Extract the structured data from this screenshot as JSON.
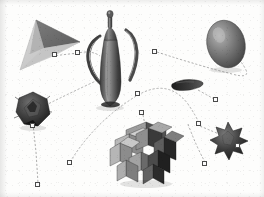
{
  "viewport": {
    "name": "3d-scene-viewport",
    "width": 264,
    "height": 197,
    "background_color": "#fdfdfc",
    "render_mode": "shaded-grayscale"
  },
  "colors": {
    "handle_fill": "#fbfbfb",
    "handle_border": "#4a4a4a",
    "path_stroke": "#9a9a9a",
    "cone_light": "#c9c9c9",
    "cone_dark": "#6e6e6e",
    "pitcher_light": "#8e8e8e",
    "pitcher_dark": "#3a3a3a",
    "egg_light": "#a8a8a8",
    "egg_dark": "#4c4c4c",
    "blade_dark": "#2b2b2b",
    "polyhedron_dark": "#3c3c3c",
    "cubecluster_light": "#b3b3b3",
    "cubecluster_mid": "#808080",
    "cubecluster_dark": "#2f2f2f",
    "star_dark": "#343434"
  },
  "objects": [
    {
      "id": "cone-object",
      "label": "Cone",
      "shape": "cone",
      "x": 38,
      "y": 45,
      "fill_light": "#c9c9c9",
      "fill_dark": "#6e6e6e"
    },
    {
      "id": "pitcher-object",
      "label": "Pitcher",
      "shape": "pitcher",
      "x": 110,
      "y": 57,
      "fill_light": "#8e8e8e",
      "fill_dark": "#3a3a3a"
    },
    {
      "id": "egg-object",
      "label": "Egg",
      "shape": "ellipsoid",
      "x": 226,
      "y": 43,
      "fill_light": "#a8a8a8",
      "fill_dark": "#4c4c4c"
    },
    {
      "id": "blade-object",
      "label": "Blade",
      "shape": "flat-blade",
      "x": 190,
      "y": 84,
      "fill_light": "#555555",
      "fill_dark": "#232323"
    },
    {
      "id": "polyhedron-object",
      "label": "Polyhedron",
      "shape": "faceted-ball",
      "x": 33,
      "y": 110,
      "fill_light": "#6a6a6a",
      "fill_dark": "#262626"
    },
    {
      "id": "cube-cluster-object",
      "label": "Cube Cluster",
      "shape": "polycube",
      "x": 146,
      "y": 157,
      "fill_light": "#b3b3b3",
      "fill_dark": "#2f2f2f"
    },
    {
      "id": "star-polyhedron-object",
      "label": "Star Polyhedron",
      "shape": "stellated",
      "x": 228,
      "y": 140,
      "fill_light": "#6d6d6d",
      "fill_dark": "#232323"
    }
  ],
  "handles": [
    {
      "id": "handle-cone-right",
      "label": "Cone right handle",
      "x": 55,
      "y": 55
    },
    {
      "id": "handle-cone-link",
      "label": "Cone link handle",
      "x": 78,
      "y": 53
    },
    {
      "id": "handle-egg-left",
      "label": "Egg left handle",
      "x": 155,
      "y": 52
    },
    {
      "id": "handle-pitcher-lower",
      "label": "Pitcher lower handle",
      "x": 138,
      "y": 94
    },
    {
      "id": "handle-blade-right",
      "label": "Blade right handle",
      "x": 216,
      "y": 100
    },
    {
      "id": "handle-cluster-top",
      "label": "Cluster top handle",
      "x": 142,
      "y": 113
    },
    {
      "id": "handle-polyhedron-bottom",
      "label": "Polyhedron bottom handle",
      "x": 33,
      "y": 126
    },
    {
      "id": "handle-arc-right",
      "label": "Arc right handle",
      "x": 199,
      "y": 124
    },
    {
      "id": "handle-arc-left",
      "label": "Arc left handle",
      "x": 70,
      "y": 163
    },
    {
      "id": "handle-star-corner",
      "label": "Star corner handle",
      "x": 238,
      "y": 146
    },
    {
      "id": "handle-curve-lower-right",
      "label": "Lower right curve handle",
      "x": 205,
      "y": 164
    },
    {
      "id": "handle-chain-bottom",
      "label": "Chain bottom handle",
      "x": 38,
      "y": 185
    }
  ],
  "connectors": [
    {
      "id": "connector-cone-to-pitcher",
      "label": "Cone to pitcher link"
    },
    {
      "id": "connector-egg-loop",
      "label": "Egg loop link"
    },
    {
      "id": "connector-pitcher-to-polyhedron",
      "label": "Pitcher to polyhedron link"
    },
    {
      "id": "connector-cluster-arc",
      "label": "Cluster arc link"
    },
    {
      "id": "connector-star-arc",
      "label": "Star arc link"
    },
    {
      "id": "connector-polyhedron-drop",
      "label": "Polyhedron drop link"
    },
    {
      "id": "connector-blade-trail",
      "label": "Blade trail link"
    }
  ]
}
